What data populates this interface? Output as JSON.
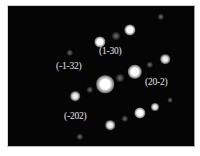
{
  "figure": {
    "type": "selected-area electron diffraction pattern",
    "background_color": "#050505",
    "spot_color": "#ffffff",
    "label_color": "#e6e6e6",
    "labels": [
      {
        "text": "(1-30)",
        "x": 98,
        "y": 45
      },
      {
        "text": "(-1-32)",
        "x": 55,
        "y": 60
      },
      {
        "text": "(20-2)",
        "x": 144,
        "y": 76
      },
      {
        "text": "(-202)",
        "x": 63,
        "y": 110
      }
    ],
    "spots": [
      {
        "id": "central",
        "x": 104,
        "y": 83,
        "size": 11,
        "intensity": "strong"
      },
      {
        "id": "20-2",
        "x": 134,
        "y": 71,
        "size": 9,
        "intensity": "strong"
      },
      {
        "id": "top",
        "x": 129,
        "y": 29,
        "size": 7,
        "intensity": "strong"
      },
      {
        "id": "1-30",
        "x": 99,
        "y": 41,
        "size": 7,
        "intensity": "strong"
      },
      {
        "id": "right",
        "x": 164,
        "y": 58,
        "size": 6,
        "intensity": "medium"
      },
      {
        "id": "-202",
        "x": 74,
        "y": 95,
        "size": 6,
        "intensity": "medium"
      },
      {
        "id": "lower-right",
        "x": 139,
        "y": 112,
        "size": 7,
        "intensity": "strong"
      },
      {
        "id": "far-lower-right",
        "x": 154,
        "y": 106,
        "size": 5,
        "intensity": "medium"
      },
      {
        "id": "bottom",
        "x": 109,
        "y": 124,
        "size": 6,
        "intensity": "medium"
      },
      {
        "id": "f1",
        "x": 115,
        "y": 35,
        "size": 5,
        "intensity": "faint"
      },
      {
        "id": "f2",
        "x": 119,
        "y": 77,
        "size": 5,
        "intensity": "faint"
      },
      {
        "id": "f3",
        "x": 160,
        "y": 16,
        "size": 4,
        "intensity": "faint"
      },
      {
        "id": "f4",
        "x": 149,
        "y": 64,
        "size": 4,
        "intensity": "faint"
      },
      {
        "id": "f5",
        "x": 69,
        "y": 52,
        "size": 4,
        "intensity": "faint"
      },
      {
        "id": "f6",
        "x": 124,
        "y": 118,
        "size": 4,
        "intensity": "faint"
      },
      {
        "id": "f7",
        "x": 89,
        "y": 89,
        "size": 4,
        "intensity": "faint"
      },
      {
        "id": "f8",
        "x": 79,
        "y": 136,
        "size": 4,
        "intensity": "faint"
      },
      {
        "id": "f9",
        "x": 169,
        "y": 99,
        "size": 3,
        "intensity": "faint"
      }
    ]
  }
}
